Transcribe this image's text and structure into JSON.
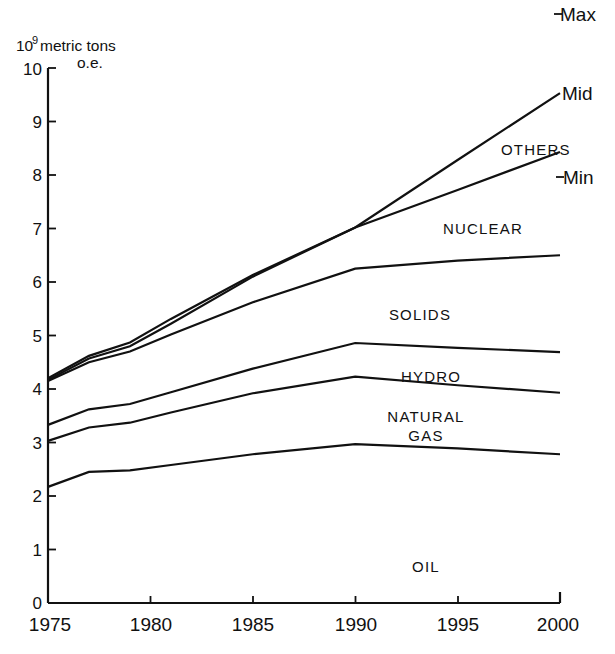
{
  "chart_data": {
    "type": "line",
    "title": "",
    "subtitle": "",
    "xlabel": "",
    "ylabel": "10^9 metric tons o.e.",
    "ylabel_mantissa": "10",
    "ylabel_exponent": "9",
    "ylabel_rest": "metric tons",
    "ylabel_rest2": "o.e.",
    "xlim": [
      1975,
      2000
    ],
    "ylim": [
      0,
      10
    ],
    "xticks": [
      1975,
      1980,
      1985,
      1990,
      1995,
      2000
    ],
    "xticklabels": [
      "1975",
      "1980",
      "1985",
      "1990",
      "1995",
      "2000"
    ],
    "yticks": [
      0,
      1,
      2,
      3,
      4,
      5,
      6,
      7,
      8,
      9,
      10
    ],
    "yticklabels": [
      "0",
      "1",
      "2",
      "3",
      "4",
      "5",
      "6",
      "7",
      "8",
      "9",
      "10"
    ],
    "grid": false,
    "legend_position": "inline-band-labels",
    "x": [
      1975,
      1977,
      1979,
      1981,
      1985,
      1990,
      1995,
      2000
    ],
    "series": [
      {
        "name": "OIL",
        "band_label": "OIL",
        "label_x": 1989.0,
        "label_y": 1.25,
        "values": [
          2.17,
          2.45,
          2.48,
          2.58,
          2.78,
          2.97,
          2.89,
          2.78
        ]
      },
      {
        "name": "NATURAL GAS",
        "band_label": "NATURAL GAS",
        "band_label_line1": "NATURAL",
        "band_label_line2": "GAS",
        "label_x": 1989.0,
        "label_y": 3.42,
        "values": [
          3.03,
          3.28,
          3.37,
          3.56,
          3.92,
          4.23,
          4.07,
          3.93
        ]
      },
      {
        "name": "HYDRO",
        "band_label": "HYDRO",
        "label_x": 1989.5,
        "label_y": 4.22,
        "values": [
          3.33,
          3.62,
          3.72,
          3.94,
          4.38,
          4.86,
          4.77,
          4.69
        ]
      },
      {
        "name": "SOLIDS",
        "band_label": "SOLIDS",
        "label_x": 1988.5,
        "label_y": 5.52,
        "values": [
          4.15,
          4.5,
          4.7,
          5.02,
          5.62,
          6.25,
          6.4,
          6.5
        ]
      },
      {
        "name": "NUCLEAR / Mid",
        "band_label": "NUCLEAR",
        "label_x": 1991.5,
        "label_y": 6.95,
        "edge_label": "Mid",
        "values": [
          4.2,
          4.62,
          4.87,
          5.31,
          6.13,
          7.02,
          8.28,
          9.53
        ]
      },
      {
        "name": "OTHERS / Min",
        "band_label": "OTHERS",
        "label_x": 1992.0,
        "label_y": 8.05,
        "edge_label": "Min",
        "values": [
          4.17,
          4.57,
          4.8,
          5.22,
          6.1,
          7.02,
          7.72,
          8.43
        ]
      }
    ],
    "annotations": [
      {
        "text": "Max",
        "x": 2000.4,
        "y": 10.75,
        "kind": "edge-label-max"
      },
      {
        "text": "Mid",
        "x": 2000.4,
        "y": 9.55,
        "kind": "edge-label"
      },
      {
        "text": "Min",
        "x": 2000.4,
        "y": 7.95,
        "kind": "edge-label"
      },
      {
        "text": "OTHERS",
        "x": 1992.0,
        "y": 8.05,
        "kind": "band-label"
      }
    ]
  },
  "labels": {
    "y_axis_unit_mantissa": "10",
    "y_axis_unit_exponent": "9",
    "y_axis_unit_text": "metric tons",
    "y_axis_unit_text2": "o.e.",
    "max": "Max",
    "mid": "Mid",
    "min": "Min",
    "others": "OTHERS",
    "nuclear": "NUCLEAR",
    "solids": "SOLIDS",
    "hydro": "HYDRO",
    "natural": "NATURAL",
    "gas": "GAS",
    "oil": "OIL",
    "y0": "0",
    "y1": "1",
    "y2": "2",
    "y3": "3",
    "y4": "4",
    "y5": "5",
    "y6": "6",
    "y7": "7",
    "y8": "8",
    "y9": "9",
    "y10": "10",
    "x1975": "1975",
    "x1980": "1980",
    "x1985": "1985",
    "x1990": "1990",
    "x1995": "1995",
    "x2000": "2000"
  },
  "colors": {
    "ink": "#111111",
    "background": "#ffffff"
  }
}
